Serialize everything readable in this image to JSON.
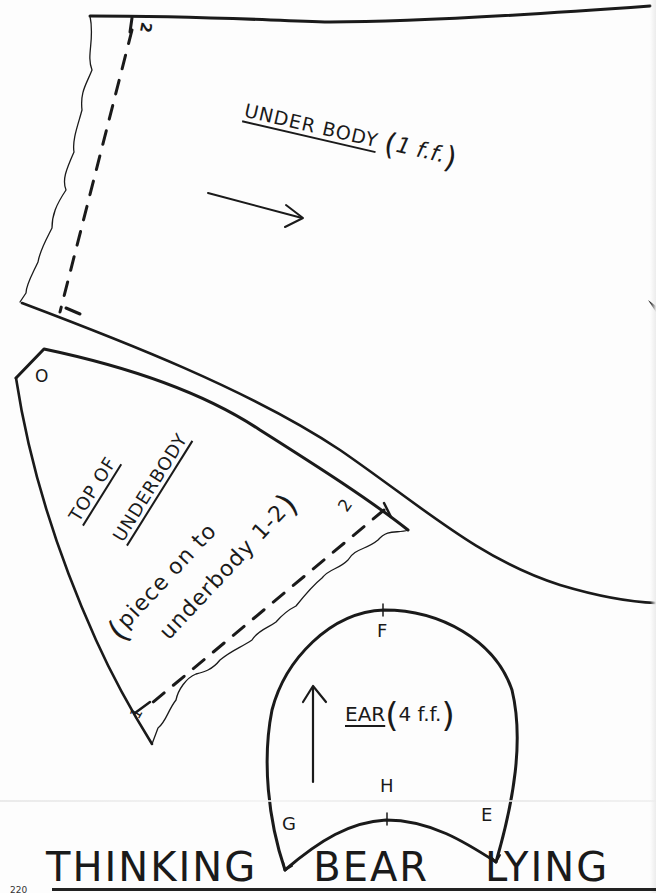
{
  "page": {
    "title_words": [
      "THINKING",
      "BEAR",
      "LYING"
    ],
    "page_number": "220"
  },
  "pieces": {
    "under_body": {
      "title": "UNDER BODY",
      "quantity": "1 f.f.",
      "paren_open": "(",
      "paren_close": ")",
      "marker_top": "2",
      "marker_bottom": "1",
      "grain_arrow": "arrow-right"
    },
    "top_of_underbody": {
      "title_line1": "TOP OF",
      "title_line2": "UNDERBODY",
      "note_line1": "piece on to",
      "note_line2": "underbody 1-2",
      "paren_open": "(",
      "paren_close": ")",
      "marker_o": "O",
      "marker_2": "2",
      "marker_1": "1"
    },
    "ear": {
      "title": "EAR",
      "quantity": "4 f.f.",
      "paren_open": "(",
      "paren_close": ")",
      "points": {
        "f": "F",
        "h": "H",
        "g": "G",
        "e": "E"
      },
      "grain_arrow": "arrow-up"
    }
  },
  "colors": {
    "ink": "#1a1a1a",
    "paper": "#fdfdfd"
  }
}
